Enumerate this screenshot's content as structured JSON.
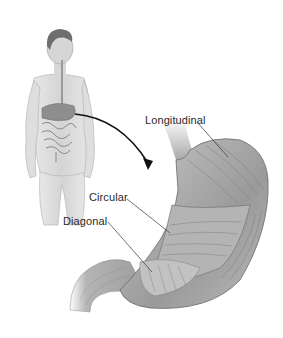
{
  "diagram": {
    "labels": {
      "longitudinal": "Longitudinal",
      "circular": "Circular",
      "diagonal": "Diagonal"
    },
    "colors": {
      "background": "#ffffff",
      "muscle_dark": "#7a7a7a",
      "muscle_mid": "#a8a8a8",
      "muscle_light": "#d6d6d6",
      "skin": "#dcdcdc",
      "leader_line": "#333333",
      "arrow": "#111111"
    }
  }
}
